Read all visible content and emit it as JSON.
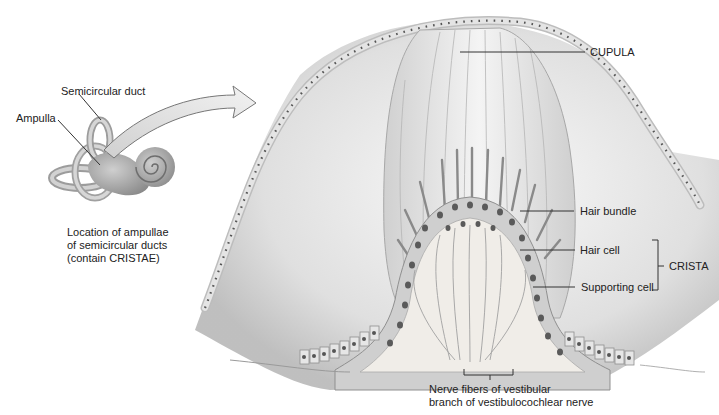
{
  "figure": {
    "inset": {
      "labels": {
        "semicircular_duct": "Semicircular duct",
        "ampulla": "Ampulla"
      },
      "caption_lines": [
        "Location of ampullae",
        "of semicircular ducts",
        "(contain CRISTAE)"
      ]
    },
    "main": {
      "labels": {
        "cupula": "CUPULA",
        "hair_bundle": "Hair bundle",
        "hair_cell": "Hair cell",
        "supporting_cell": "Supporting cell",
        "crista": "CRISTA"
      },
      "nerve_caption_lines": [
        "Nerve fibers of vestibular",
        "branch of vestibulocochlear nerve"
      ]
    },
    "colors": {
      "background": "#ffffff",
      "membrane": "#cfcfcf",
      "membrane_cell": "#e6e6e6",
      "nucleus": "#555555",
      "cupula": "#e2e2e2",
      "leader_line": "#333333",
      "text": "#222222"
    }
  }
}
